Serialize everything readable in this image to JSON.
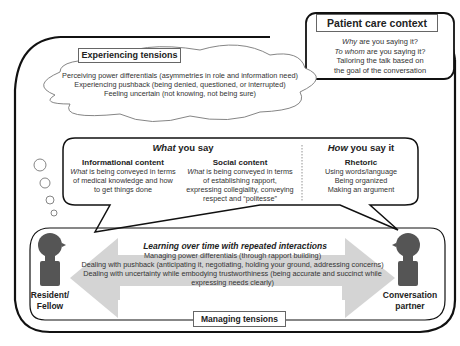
{
  "patient_care_context": {
    "title": "Patient care context",
    "lines": [
      {
        "em": "Why",
        "rest": " are you saying it?"
      },
      {
        "em": "To whom",
        "rest": " are you saying it?"
      },
      {
        "em": "",
        "rest": "Tailoring the talk based on"
      },
      {
        "em": "",
        "rest": "the goal of the conversation"
      }
    ]
  },
  "experiencing_tensions": {
    "title": "Experiencing tensions",
    "items": [
      "Perceiving power differentials (asymmetries in role and information need)",
      "Experiencing pushback (being denied, questioned, or interrupted)",
      "Feeling uncertain (not knowing, not being sure)"
    ]
  },
  "what_you_say": {
    "title_em": "What",
    "title_rest": " you say",
    "informational": {
      "heading": "Informational content",
      "lines": [
        {
          "em": "What",
          "rest": " is being conveyed in terms"
        },
        {
          "em": "",
          "rest": "of medical knowledge and how"
        },
        {
          "em": "",
          "rest": "to get things done"
        }
      ]
    },
    "social": {
      "heading": "Social content",
      "lines": [
        {
          "em": "What",
          "rest": " is being conveyed in terms"
        },
        {
          "em": "",
          "rest": "of establishing rapport,"
        },
        {
          "em": "",
          "rest": "expressing collegiality, conveying"
        },
        {
          "em": "",
          "rest": "respect and “politesse”"
        }
      ]
    }
  },
  "how_you_say_it": {
    "title_em": "How",
    "title_rest": " you say it",
    "heading": "Rhetoric",
    "lines": [
      "Using words/language",
      "Being organized",
      "Making an argument"
    ]
  },
  "managing_tensions": {
    "title": "Managing tensions",
    "arrow_title": "Learning over time with repeated interactions",
    "items": [
      "Managing power differentials (through rapport building)",
      "Dealing with pushback (anticipating it, negotiating, holding your ground, addressing concerns)",
      "Dealing with uncertainty while embodying trustworthiness (being accurate and succinct while",
      "expressing needs clearly)"
    ]
  },
  "people": {
    "left": {
      "line1": "Resident/",
      "line2": "Fellow"
    },
    "right": {
      "line1": "Conversation",
      "line2": "partner"
    }
  },
  "colors": {
    "outline": "#111111",
    "person_fill": "#555555",
    "arrow_fill": "#d4d4d4",
    "text": "#222222"
  }
}
